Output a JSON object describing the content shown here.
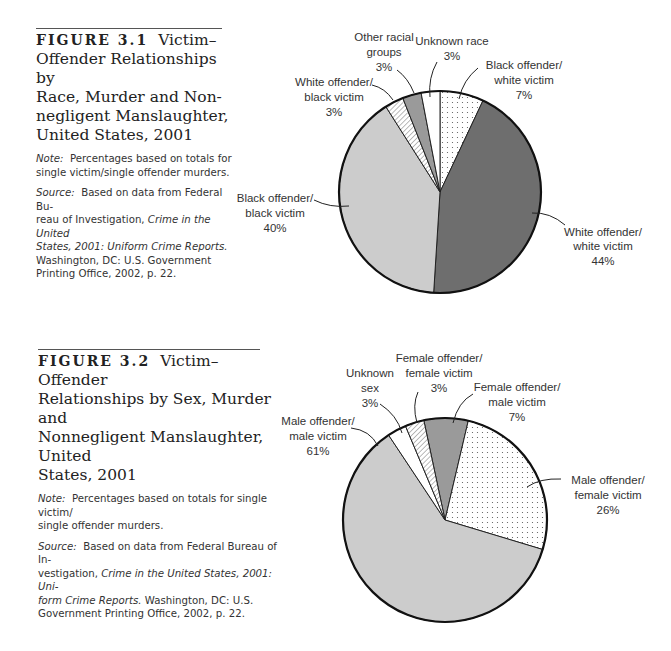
{
  "figure_1": {
    "number": "FIGURE 3.1",
    "title": "Victim–Offender Relationships by Race, Murder and Non-negligent Manslaughter, United States, 2001",
    "title_lines": [
      "Victim–",
      "Offender Relationships by",
      "Race, Murder and Non-",
      "negligent Manslaughter,",
      "United States, 2001"
    ],
    "note_label": "Note:",
    "note_lines": [
      "Percentages based on totals for",
      "single victim/single offender murders."
    ],
    "source_label": "Source:",
    "source_lines": [
      {
        "pre": "Based on data from Federal Bu-",
        "it": ""
      },
      {
        "pre": "reau of Investigation, ",
        "it": "Crime in the United"
      },
      {
        "pre": "",
        "it": "States, 2001: Uniform Crime Reports."
      },
      {
        "pre": "Washington, DC: U.S. Government",
        "it": ""
      },
      {
        "pre": "Printing Office, 2002, p. 22.",
        "it": ""
      }
    ]
  },
  "figure_2": {
    "number": "FIGURE 3.2",
    "title": "Victim–Offender Relationships by Sex, Murder and Nonnegligent Manslaughter, United States, 2001",
    "title_lines": [
      "Victim–Offender",
      "Relationships by Sex, Murder and",
      "Nonnegligent Manslaughter, United",
      "States, 2001"
    ],
    "note_label": "Note:",
    "note_lines": [
      "Percentages based on totals for single victim/",
      "single offender murders."
    ],
    "source_label": "Source:",
    "source_lines": [
      {
        "pre": "Based on data from Federal Bureau of In-",
        "it": ""
      },
      {
        "pre": "vestigation, ",
        "it": "Crime in the United States, 2001: Uni-"
      },
      {
        "pre": "",
        "it": "form Crime Reports.",
        "post": " Washington, DC: U.S."
      },
      {
        "pre": "Government Printing Office, 2002, p. 22.",
        "it": ""
      }
    ]
  },
  "chart_data": [
    {
      "type": "pie",
      "title": "Victim–Offender Relationships by Race, Murder and Nonnegligent Manslaughter, United States, 2001",
      "categories": [
        "Black offender/white victim",
        "White offender/white victim",
        "Black offender/black victim",
        "White offender/black victim",
        "Other racial groups",
        "Unknown race"
      ],
      "values": [
        7,
        44,
        40,
        3,
        3,
        3
      ],
      "labels": [
        "7%",
        "44%",
        "40%",
        "3%",
        "3%",
        "3%"
      ],
      "fills": [
        "dots",
        "#6e6e6e",
        "#cccccc",
        "hatch",
        "#9a9a9a",
        "#ffffff"
      ],
      "start_angle_deg": 0,
      "direction": "clockwise"
    },
    {
      "type": "pie",
      "title": "Victim–Offender Relationships by Sex, Murder and Nonnegligent Manslaughter, United States, 2001",
      "categories": [
        "Female offender/male victim",
        "Male offender/female victim",
        "Male offender/male victim",
        "Unknown sex",
        "Female offender/female victim"
      ],
      "values": [
        7,
        26,
        61,
        3,
        3
      ],
      "labels": [
        "7%",
        "26%",
        "61%",
        "3%",
        "3%"
      ],
      "fills": [
        "#9a9a9a",
        "dots",
        "#cccccc",
        "#ffffff",
        "hatch"
      ],
      "start_angle_deg": -12,
      "direction": "clockwise"
    }
  ],
  "pie_1_labels": {
    "bw": [
      "Black offender/",
      "white victim",
      "7%"
    ],
    "ww": [
      "White offender/",
      "white victim",
      "44%"
    ],
    "bb": [
      "Black offender/",
      "black victim",
      "40%"
    ],
    "wb": [
      "White offender/",
      "black victim",
      "3%"
    ],
    "other": [
      "Other racial",
      "groups",
      "3%"
    ],
    "unknown": [
      "Unknown race",
      "3%"
    ]
  },
  "pie_2_labels": {
    "fm": [
      "Female offender/",
      "male victim",
      "7%"
    ],
    "mf": [
      "Male offender/",
      "female victim",
      "26%"
    ],
    "mm": [
      "Male offender/",
      "male victim",
      "61%"
    ],
    "unknown": [
      "Unknown",
      "sex",
      "3%"
    ],
    "ff": [
      "Female offender/",
      "female victim",
      "3%"
    ]
  }
}
